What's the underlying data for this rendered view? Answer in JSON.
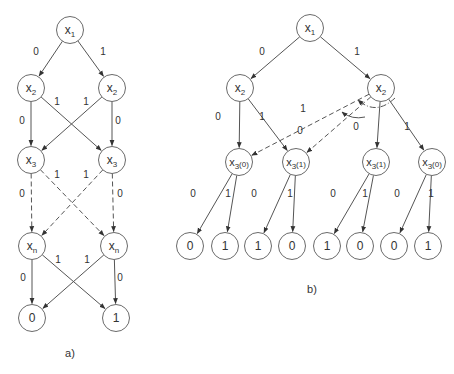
{
  "panels": [
    {
      "id": "a",
      "caption": "a)",
      "nodes": [
        {
          "id": "a_x1",
          "label": "x",
          "sub": "1",
          "suffix": "",
          "x": 70,
          "y": 30
        },
        {
          "id": "a_x2l",
          "label": "x",
          "sub": "2",
          "suffix": "",
          "x": 31,
          "y": 88
        },
        {
          "id": "a_x2r",
          "label": "x",
          "sub": "2",
          "suffix": "",
          "x": 112,
          "y": 88
        },
        {
          "id": "a_x3l",
          "label": "x",
          "sub": "3",
          "suffix": "",
          "x": 31,
          "y": 160
        },
        {
          "id": "a_x3r",
          "label": "x",
          "sub": "3",
          "suffix": "",
          "x": 112,
          "y": 160
        },
        {
          "id": "a_xnl",
          "label": "x",
          "sub": "n",
          "suffix": "",
          "x": 32,
          "y": 246
        },
        {
          "id": "a_xnr",
          "label": "x",
          "sub": "n",
          "suffix": "",
          "x": 114,
          "y": 246
        },
        {
          "id": "a_t0",
          "label": "0",
          "sub": "",
          "suffix": "",
          "x": 32,
          "y": 318
        },
        {
          "id": "a_t1",
          "label": "1",
          "sub": "",
          "suffix": "",
          "x": 116,
          "y": 318
        }
      ],
      "edges": [
        {
          "from": "a_x1",
          "to": "a_x2l",
          "label": "0",
          "style": "solid",
          "lx": 36,
          "ly": 55
        },
        {
          "from": "a_x1",
          "to": "a_x2r",
          "label": "1",
          "style": "solid",
          "lx": 103,
          "ly": 55
        },
        {
          "from": "a_x2l",
          "to": "a_x3l",
          "label": "0",
          "style": "solid",
          "lx": 22,
          "ly": 124
        },
        {
          "from": "a_x2l",
          "to": "a_x3r",
          "label": "1",
          "style": "solid",
          "lx": 57,
          "ly": 105
        },
        {
          "from": "a_x2r",
          "to": "a_x3l",
          "label": "1",
          "style": "solid",
          "lx": 86,
          "ly": 105
        },
        {
          "from": "a_x2r",
          "to": "a_x3r",
          "label": "0",
          "style": "solid",
          "lx": 118,
          "ly": 124
        },
        {
          "from": "a_x3l",
          "to": "a_xnl",
          "label": "0",
          "style": "dashed",
          "lx": 22,
          "ly": 197
        },
        {
          "from": "a_x3l",
          "to": "a_xnr",
          "label": "1",
          "style": "dashed",
          "lx": 57,
          "ly": 178
        },
        {
          "from": "a_x3r",
          "to": "a_xnl",
          "label": "1",
          "style": "dashed",
          "lx": 86,
          "ly": 178
        },
        {
          "from": "a_x3r",
          "to": "a_xnr",
          "label": "0",
          "style": "dashed",
          "lx": 120,
          "ly": 197
        },
        {
          "from": "a_xnl",
          "to": "a_t0",
          "label": "0",
          "style": "solid",
          "lx": 23,
          "ly": 281
        },
        {
          "from": "a_xnl",
          "to": "a_t1",
          "label": "1",
          "style": "solid",
          "lx": 58,
          "ly": 263
        },
        {
          "from": "a_xnr",
          "to": "a_t0",
          "label": "1",
          "style": "solid",
          "lx": 87,
          "ly": 263
        },
        {
          "from": "a_xnr",
          "to": "a_t1",
          "label": "0",
          "style": "solid",
          "lx": 120,
          "ly": 281
        }
      ]
    },
    {
      "id": "b",
      "caption": "b)",
      "nodes": [
        {
          "id": "b_x1",
          "label": "x",
          "sub": "1",
          "suffix": "",
          "x": 310,
          "y": 28
        },
        {
          "id": "b_x2l",
          "label": "x",
          "sub": "2",
          "suffix": "",
          "x": 240,
          "y": 88
        },
        {
          "id": "b_x2r",
          "label": "x",
          "sub": "2",
          "suffix": "",
          "x": 381,
          "y": 88
        },
        {
          "id": "b_x3a",
          "label": "x",
          "sub": "3",
          "suffix": "(0)",
          "x": 239,
          "y": 162
        },
        {
          "id": "b_x3b",
          "label": "x",
          "sub": "3",
          "suffix": "(1)",
          "x": 296,
          "y": 162
        },
        {
          "id": "b_x3c",
          "label": "x",
          "sub": "3",
          "suffix": "(1)",
          "x": 376,
          "y": 162
        },
        {
          "id": "b_x3d",
          "label": "x",
          "sub": "3",
          "suffix": "(0)",
          "x": 432,
          "y": 162
        },
        {
          "id": "b_l1",
          "label": "0",
          "sub": "",
          "suffix": "",
          "x": 190,
          "y": 246
        },
        {
          "id": "b_l2",
          "label": "1",
          "sub": "",
          "suffix": "",
          "x": 225,
          "y": 246
        },
        {
          "id": "b_l3",
          "label": "1",
          "sub": "",
          "suffix": "",
          "x": 258,
          "y": 246
        },
        {
          "id": "b_l4",
          "label": "0",
          "sub": "",
          "suffix": "",
          "x": 292,
          "y": 246
        },
        {
          "id": "b_l5",
          "label": "1",
          "sub": "",
          "suffix": "",
          "x": 327,
          "y": 246
        },
        {
          "id": "b_l6",
          "label": "0",
          "sub": "",
          "suffix": "",
          "x": 360,
          "y": 246
        },
        {
          "id": "b_l7",
          "label": "0",
          "sub": "",
          "suffix": "",
          "x": 394,
          "y": 246
        },
        {
          "id": "b_l8",
          "label": "1",
          "sub": "",
          "suffix": "",
          "x": 428,
          "y": 246
        }
      ],
      "edges": [
        {
          "from": "b_x1",
          "to": "b_x2l",
          "label": "0",
          "style": "solid",
          "lx": 262,
          "ly": 55
        },
        {
          "from": "b_x1",
          "to": "b_x2r",
          "label": "1",
          "style": "solid",
          "lx": 357,
          "ly": 55
        },
        {
          "from": "b_x2l",
          "to": "b_x3a",
          "label": "0",
          "style": "solid",
          "lx": 218,
          "ly": 120
        },
        {
          "from": "b_x2l",
          "to": "b_x3b",
          "label": "1",
          "style": "solid",
          "lx": 262,
          "ly": 120
        },
        {
          "from": "b_x2r",
          "to": "b_x3a",
          "label": "1",
          "style": "dashed",
          "lx": 303,
          "ly": 112
        },
        {
          "from": "b_x2r",
          "to": "b_x3b",
          "label": "0",
          "style": "dashed",
          "lx": 300,
          "ly": 134
        },
        {
          "from": "b_x2r",
          "to": "b_x3c",
          "label": "0",
          "style": "solid",
          "lx": 356,
          "ly": 130
        },
        {
          "from": "b_x2r",
          "to": "b_x3d",
          "label": "1",
          "style": "solid",
          "lx": 407,
          "ly": 130
        },
        {
          "from": "b_x3a",
          "to": "b_l1",
          "label": "0",
          "style": "solid",
          "lx": 193,
          "ly": 197
        },
        {
          "from": "b_x3a",
          "to": "b_l2",
          "label": "1",
          "style": "solid",
          "lx": 228,
          "ly": 197
        },
        {
          "from": "b_x3b",
          "to": "b_l3",
          "label": "0",
          "style": "solid",
          "lx": 254,
          "ly": 197
        },
        {
          "from": "b_x3b",
          "to": "b_l4",
          "label": "1",
          "style": "solid",
          "lx": 290,
          "ly": 197
        },
        {
          "from": "b_x3c",
          "to": "b_l5",
          "label": "0",
          "style": "solid",
          "lx": 333,
          "ly": 197
        },
        {
          "from": "b_x3c",
          "to": "b_l6",
          "label": "1",
          "style": "solid",
          "lx": 365,
          "ly": 197
        },
        {
          "from": "b_x3d",
          "to": "b_l7",
          "label": "0",
          "style": "solid",
          "lx": 397,
          "ly": 197
        },
        {
          "from": "b_x3d",
          "to": "b_l8",
          "label": "1",
          "style": "solid",
          "lx": 431,
          "ly": 197
        }
      ],
      "swap_arcs": [
        {
          "d": "M 395 98 Q 376 116 358 100",
          "style": "dashdot"
        },
        {
          "d": "M 365 117 Q 352 120 342 112",
          "style": "solid"
        }
      ]
    }
  ],
  "style": {
    "node_radius": 13.5,
    "stroke_color": "#555555",
    "text_color": "#333333"
  }
}
